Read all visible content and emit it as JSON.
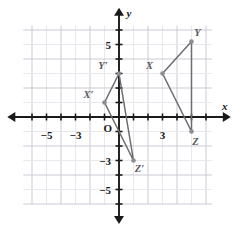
{
  "figure": {
    "axis_labels": {
      "x": "x",
      "y": "y"
    },
    "origin_label": "O",
    "colors": {
      "grid_minor": "#e8e8ee",
      "grid_major": "#c9c9d4",
      "axis": "#1a1a1a",
      "shape_stroke": "#6b6b70",
      "vertex_fill": "#8c8c92",
      "label_text": "#59595b",
      "tick_text": "#1a1a1a",
      "background": "#ffffff"
    }
  },
  "chart_data": {
    "type": "scatter",
    "title": "",
    "xlabel": "x",
    "ylabel": "y",
    "xlim": [
      -6.6,
      7.0
    ],
    "ylim": [
      -6.3,
      6.6
    ],
    "grid": true,
    "grid_step": 1,
    "legend": "none",
    "x_tick_labels": [
      {
        "value": -5,
        "text": "−5"
      },
      {
        "value": -3,
        "text": "−3"
      },
      {
        "value": 3,
        "text": "3"
      }
    ],
    "y_tick_labels": [
      {
        "value": 5,
        "text": "5"
      },
      {
        "value": -3,
        "text": "−3"
      },
      {
        "value": -5,
        "text": "−5"
      }
    ],
    "series": [
      {
        "name": "Triangle XYZ",
        "closed": true,
        "points": [
          {
            "label": "X",
            "x": 3,
            "y": 3,
            "label_dx": -13,
            "label_dy": -5
          },
          {
            "label": "Y",
            "x": 5,
            "y": 5.2,
            "label_dx": 6,
            "label_dy": -6
          },
          {
            "label": "Z",
            "x": 5,
            "y": -1,
            "label_dx": 4,
            "label_dy": 13
          }
        ]
      },
      {
        "name": "Triangle X'Y'Z' (image)",
        "closed": true,
        "points": [
          {
            "label": "X′",
            "x": -1,
            "y": 1,
            "label_dx": -16,
            "label_dy": -5
          },
          {
            "label": "Y′",
            "x": 0,
            "y": 3,
            "label_dx": -16,
            "label_dy": -5
          },
          {
            "label": "Z′",
            "x": 1,
            "y": -3,
            "label_dx": 6,
            "label_dy": 11
          }
        ]
      }
    ]
  }
}
